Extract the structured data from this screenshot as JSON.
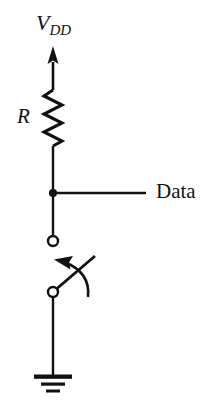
{
  "figure": {
    "name": "pull-up-resistor-switch-circuit",
    "background_color": "#ffffff",
    "stroke_color": "#111111",
    "width": 211,
    "height": 418
  },
  "labels": {
    "supply": {
      "base": "V",
      "subscript": "DD",
      "full": "VDD",
      "style": "italic-serif"
    },
    "resistor": {
      "text": "R",
      "style": "italic-serif"
    },
    "output": {
      "text": "Data",
      "style": "upright-serif"
    }
  },
  "components": [
    {
      "name": "supply-arrow",
      "type": "arrow",
      "direction": "up",
      "label": "VDD"
    },
    {
      "name": "resistor",
      "type": "resistor-zigzag",
      "label": "R",
      "zigzag_peaks": 5
    },
    {
      "name": "junction-node",
      "type": "filled-dot",
      "label": ""
    },
    {
      "name": "data-tap-wire",
      "type": "wire",
      "orientation": "horizontal",
      "label": "Data"
    },
    {
      "name": "upper-terminal",
      "type": "open-circle",
      "label": ""
    },
    {
      "name": "switch-blade",
      "type": "spst-switch",
      "state": "open",
      "label": ""
    },
    {
      "name": "actuation-arrow",
      "type": "curved-arrow",
      "label": ""
    },
    {
      "name": "lower-terminal",
      "type": "open-circle",
      "label": ""
    },
    {
      "name": "ground",
      "type": "ground-symbol",
      "bars": 3,
      "label": ""
    }
  ]
}
